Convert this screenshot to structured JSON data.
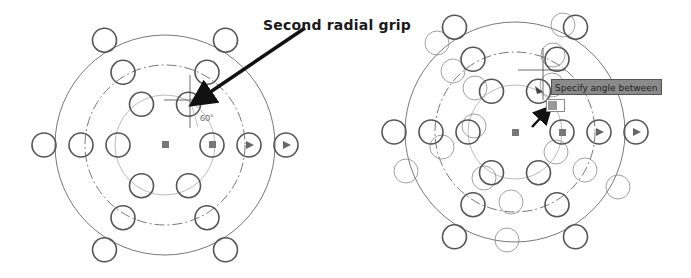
{
  "figure": {
    "callout_label": "Second radial grip",
    "left_panel": {
      "description": "Polar array with radial grip being dragged",
      "angle_dimension": "60°",
      "center": [
        165,
        145
      ],
      "rings": [
        {
          "radius": 47,
          "count": 6,
          "style": "bold"
        },
        {
          "radius": 92,
          "count": 6,
          "style": "bold"
        },
        {
          "radius": 125,
          "count": 6,
          "style": "bold"
        }
      ],
      "guide_circles": [
        {
          "radius": 55,
          "style": "solid-light"
        },
        {
          "radius": 80,
          "style": "dash-dot"
        },
        {
          "radius": 110,
          "style": "solid"
        }
      ]
    },
    "right_panel": {
      "description": "Polar array preview while specifying angle",
      "tooltip": "Specify angle between items:",
      "center": [
        515,
        132
      ]
    }
  }
}
